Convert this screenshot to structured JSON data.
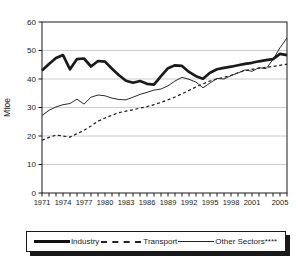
{
  "chart_data": {
    "type": "line",
    "title": "",
    "xlabel": "",
    "ylabel": "Mtoe",
    "ylim": [
      0,
      60
    ],
    "y_ticks": [
      0,
      10,
      20,
      30,
      40,
      50,
      60
    ],
    "x_tick_labels": [
      "1971",
      "1974",
      "1977",
      "1980",
      "1983",
      "1986",
      "1989",
      "1992",
      "1995",
      "1998",
      "2001",
      "2005"
    ],
    "grid": "horizontal",
    "legend_position": "bottom",
    "x": [
      1971,
      1972,
      1973,
      1974,
      1975,
      1976,
      1977,
      1978,
      1979,
      1980,
      1981,
      1982,
      1983,
      1984,
      1985,
      1986,
      1987,
      1988,
      1989,
      1990,
      1991,
      1992,
      1993,
      1994,
      1995,
      1996,
      1997,
      1998,
      1999,
      2000,
      2001,
      2002,
      2003,
      2004,
      2005,
      2006
    ],
    "series": [
      {
        "name": "Industry",
        "style": "thick-solid",
        "values": [
          43.0,
          45.3,
          47.4,
          48.4,
          43.4,
          47.0,
          47.2,
          44.4,
          46.3,
          46.1,
          43.6,
          41.3,
          39.4,
          38.7,
          39.3,
          38.3,
          38.0,
          41.0,
          43.8,
          44.8,
          44.6,
          42.5,
          41.0,
          40.1,
          42.2,
          43.4,
          43.9,
          44.3,
          44.8,
          45.3,
          45.7,
          46.2,
          46.6,
          47.0,
          48.8,
          48.4
        ]
      },
      {
        "name": "Transport",
        "style": "dashed",
        "values": [
          18.5,
          19.5,
          20.3,
          20.0,
          19.6,
          20.8,
          22.0,
          23.5,
          25.2,
          26.3,
          27.3,
          28.2,
          28.7,
          29.2,
          29.8,
          30.3,
          31.0,
          31.8,
          32.7,
          33.7,
          34.8,
          36.0,
          37.2,
          38.3,
          39.3,
          40.0,
          40.6,
          41.3,
          42.2,
          43.0,
          43.4,
          43.8,
          44.1,
          44.4,
          44.8,
          45.2
        ]
      },
      {
        "name": "Other Sectors****",
        "style": "thin-solid",
        "values": [
          27.2,
          29.0,
          30.2,
          31.0,
          31.4,
          32.9,
          31.2,
          33.6,
          34.4,
          34.1,
          33.3,
          32.8,
          32.7,
          33.6,
          34.6,
          35.3,
          36.1,
          36.5,
          37.6,
          39.3,
          40.6,
          39.9,
          38.9,
          36.9,
          38.6,
          40.2,
          40.0,
          41.2,
          42.1,
          43.2,
          42.7,
          44.0,
          43.6,
          46.8,
          51.0,
          54.4
        ]
      }
    ]
  },
  "colors": {
    "line": "#1a1a1a",
    "thin_line": "#2b2b2b",
    "grid": "#c6c6c6",
    "axis": "#1a1a1a",
    "background": "#ffffff",
    "text": "#1a1a1a"
  }
}
